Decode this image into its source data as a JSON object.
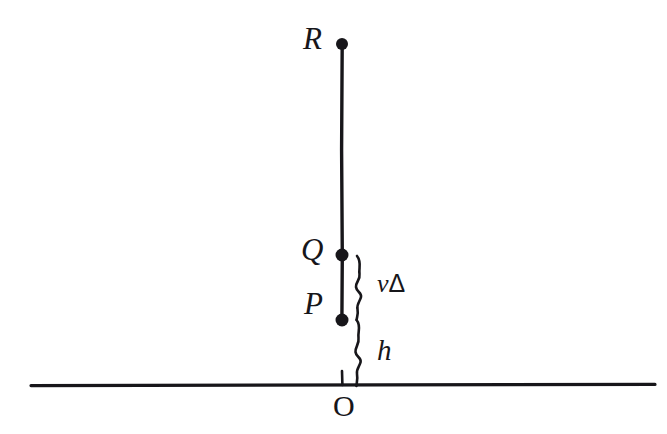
{
  "figure": {
    "background_color": "#ffffff",
    "ink_color": "#17161a",
    "width": 667,
    "height": 434
  },
  "points": [
    {
      "id": "R",
      "label": "R",
      "x": 342,
      "y": 44,
      "label_x": 303,
      "label_y": 23,
      "has_dot": true,
      "dot_radius": 6
    },
    {
      "id": "Q",
      "label": "Q",
      "x": 342,
      "y": 255,
      "label_x": 301,
      "label_y": 234,
      "has_dot": true,
      "dot_radius": 6.5
    },
    {
      "id": "P",
      "label": "P",
      "x": 342,
      "y": 320,
      "label_x": 304,
      "label_y": 288,
      "has_dot": true,
      "dot_radius": 6.5
    },
    {
      "id": "O",
      "label": "O",
      "x": 342,
      "y": 385,
      "label_x": 333,
      "label_y": 391,
      "has_dot": false,
      "dot_radius": 0
    }
  ],
  "segments": {
    "vertical_worldline": {
      "name": "vertical-worldline",
      "x": 342,
      "y_top": 44,
      "y_bottom": 320,
      "stroke_width": 3.4
    },
    "ground_axis": {
      "name": "ground-axis",
      "x_left": 31,
      "x_right": 655,
      "y": 385,
      "stroke_width": 3.2
    },
    "origin_tick": {
      "name": "origin-tick",
      "x": 342,
      "y_top": 371,
      "y_bottom": 385,
      "stroke_width": 2.6
    }
  },
  "braces": [
    {
      "id": "brace-v-delta",
      "measures": "vΔ",
      "x": 360,
      "y_top": 255,
      "y_bottom": 320,
      "stroke_width": 2.6
    },
    {
      "id": "brace-h",
      "measures": "h",
      "x": 360,
      "y_top": 320,
      "y_bottom": 385,
      "stroke_width": 2.6
    }
  ],
  "measure_labels": {
    "v_delta": {
      "id": "v-delta",
      "variable": "v",
      "delta": "Δ",
      "full_text": "vΔ",
      "x": 377,
      "y": 271
    },
    "h": {
      "id": "h",
      "text": "h",
      "x": 377,
      "y": 336
    }
  }
}
